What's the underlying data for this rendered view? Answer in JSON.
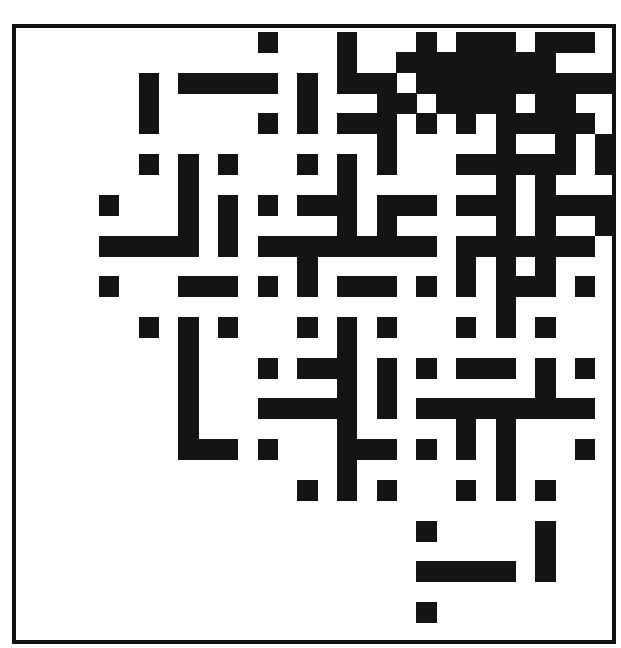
{
  "figure": {
    "type": "binary-grid-pattern",
    "grid_cols": 30,
    "grid_rows": 30,
    "cell_w": 19.83,
    "cell_h": 20.36,
    "colors": {
      "ink": "#141414",
      "paper": "#ffffff",
      "frame": "#111111"
    },
    "black_cells": [
      [
        12,
        0
      ],
      [
        16,
        0
      ],
      [
        20,
        0
      ],
      [
        22,
        0
      ],
      [
        23,
        0
      ],
      [
        24,
        0
      ],
      [
        26,
        0
      ],
      [
        27,
        0
      ],
      [
        28,
        0
      ],
      [
        16,
        1
      ],
      [
        19,
        1
      ],
      [
        20,
        1
      ],
      [
        21,
        1
      ],
      [
        22,
        1
      ],
      [
        23,
        1
      ],
      [
        24,
        1
      ],
      [
        25,
        1
      ],
      [
        26,
        1
      ],
      [
        6,
        2
      ],
      [
        8,
        2
      ],
      [
        9,
        2
      ],
      [
        10,
        2
      ],
      [
        11,
        2
      ],
      [
        12,
        2
      ],
      [
        14,
        2
      ],
      [
        16,
        2
      ],
      [
        17,
        2
      ],
      [
        18,
        2
      ],
      [
        20,
        2
      ],
      [
        21,
        2
      ],
      [
        22,
        2
      ],
      [
        23,
        2
      ],
      [
        24,
        2
      ],
      [
        25,
        2
      ],
      [
        26,
        2
      ],
      [
        27,
        2
      ],
      [
        28,
        2
      ],
      [
        29,
        2
      ],
      [
        6,
        3
      ],
      [
        14,
        3
      ],
      [
        18,
        3
      ],
      [
        19,
        3
      ],
      [
        21,
        3
      ],
      [
        22,
        3
      ],
      [
        23,
        3
      ],
      [
        24,
        3
      ],
      [
        26,
        3
      ],
      [
        27,
        3
      ],
      [
        6,
        4
      ],
      [
        12,
        4
      ],
      [
        14,
        4
      ],
      [
        16,
        4
      ],
      [
        17,
        4
      ],
      [
        18,
        4
      ],
      [
        20,
        4
      ],
      [
        22,
        4
      ],
      [
        24,
        4
      ],
      [
        25,
        4
      ],
      [
        26,
        4
      ],
      [
        27,
        4
      ],
      [
        28,
        4
      ],
      [
        18,
        5
      ],
      [
        24,
        5
      ],
      [
        27,
        5
      ],
      [
        29,
        5
      ],
      [
        6,
        6
      ],
      [
        8,
        6
      ],
      [
        10,
        6
      ],
      [
        14,
        6
      ],
      [
        16,
        6
      ],
      [
        18,
        6
      ],
      [
        22,
        6
      ],
      [
        23,
        6
      ],
      [
        24,
        6
      ],
      [
        25,
        6
      ],
      [
        26,
        6
      ],
      [
        27,
        6
      ],
      [
        29,
        6
      ],
      [
        8,
        7
      ],
      [
        16,
        7
      ],
      [
        24,
        7
      ],
      [
        26,
        7
      ],
      [
        4,
        8
      ],
      [
        8,
        8
      ],
      [
        10,
        8
      ],
      [
        12,
        8
      ],
      [
        14,
        8
      ],
      [
        15,
        8
      ],
      [
        16,
        8
      ],
      [
        18,
        8
      ],
      [
        19,
        8
      ],
      [
        20,
        8
      ],
      [
        22,
        8
      ],
      [
        23,
        8
      ],
      [
        24,
        8
      ],
      [
        26,
        8
      ],
      [
        27,
        8
      ],
      [
        28,
        8
      ],
      [
        29,
        8
      ],
      [
        8,
        9
      ],
      [
        10,
        9
      ],
      [
        16,
        9
      ],
      [
        18,
        9
      ],
      [
        24,
        9
      ],
      [
        26,
        9
      ],
      [
        29,
        9
      ],
      [
        4,
        10
      ],
      [
        5,
        10
      ],
      [
        6,
        10
      ],
      [
        7,
        10
      ],
      [
        8,
        10
      ],
      [
        10,
        10
      ],
      [
        12,
        10
      ],
      [
        13,
        10
      ],
      [
        14,
        10
      ],
      [
        15,
        10
      ],
      [
        16,
        10
      ],
      [
        17,
        10
      ],
      [
        18,
        10
      ],
      [
        19,
        10
      ],
      [
        20,
        10
      ],
      [
        22,
        10
      ],
      [
        23,
        10
      ],
      [
        24,
        10
      ],
      [
        25,
        10
      ],
      [
        26,
        10
      ],
      [
        27,
        10
      ],
      [
        28,
        10
      ],
      [
        14,
        11
      ],
      [
        22,
        11
      ],
      [
        24,
        11
      ],
      [
        26,
        11
      ],
      [
        4,
        12
      ],
      [
        8,
        12
      ],
      [
        9,
        12
      ],
      [
        10,
        12
      ],
      [
        12,
        12
      ],
      [
        14,
        12
      ],
      [
        16,
        12
      ],
      [
        17,
        12
      ],
      [
        18,
        12
      ],
      [
        20,
        12
      ],
      [
        22,
        12
      ],
      [
        24,
        12
      ],
      [
        25,
        12
      ],
      [
        26,
        12
      ],
      [
        28,
        12
      ],
      [
        24,
        13
      ],
      [
        6,
        14
      ],
      [
        8,
        14
      ],
      [
        10,
        14
      ],
      [
        14,
        14
      ],
      [
        16,
        14
      ],
      [
        18,
        14
      ],
      [
        22,
        14
      ],
      [
        24,
        14
      ],
      [
        26,
        14
      ],
      [
        8,
        15
      ],
      [
        16,
        15
      ],
      [
        8,
        16
      ],
      [
        12,
        16
      ],
      [
        14,
        16
      ],
      [
        15,
        16
      ],
      [
        16,
        16
      ],
      [
        18,
        16
      ],
      [
        20,
        16
      ],
      [
        22,
        16
      ],
      [
        23,
        16
      ],
      [
        24,
        16
      ],
      [
        26,
        16
      ],
      [
        28,
        16
      ],
      [
        8,
        17
      ],
      [
        16,
        17
      ],
      [
        18,
        17
      ],
      [
        26,
        17
      ],
      [
        8,
        18
      ],
      [
        12,
        18
      ],
      [
        13,
        18
      ],
      [
        14,
        18
      ],
      [
        15,
        18
      ],
      [
        16,
        18
      ],
      [
        18,
        18
      ],
      [
        20,
        18
      ],
      [
        21,
        18
      ],
      [
        22,
        18
      ],
      [
        23,
        18
      ],
      [
        24,
        18
      ],
      [
        25,
        18
      ],
      [
        26,
        18
      ],
      [
        27,
        18
      ],
      [
        28,
        18
      ],
      [
        8,
        19
      ],
      [
        16,
        19
      ],
      [
        22,
        19
      ],
      [
        24,
        19
      ],
      [
        8,
        20
      ],
      [
        9,
        20
      ],
      [
        10,
        20
      ],
      [
        12,
        20
      ],
      [
        16,
        20
      ],
      [
        17,
        20
      ],
      [
        18,
        20
      ],
      [
        20,
        20
      ],
      [
        22,
        20
      ],
      [
        24,
        20
      ],
      [
        28,
        20
      ],
      [
        16,
        21
      ],
      [
        24,
        21
      ],
      [
        14,
        22
      ],
      [
        16,
        22
      ],
      [
        18,
        22
      ],
      [
        22,
        22
      ],
      [
        24,
        22
      ],
      [
        26,
        22
      ],
      [
        20,
        24
      ],
      [
        26,
        24
      ],
      [
        26,
        25
      ],
      [
        20,
        26
      ],
      [
        21,
        26
      ],
      [
        22,
        26
      ],
      [
        23,
        26
      ],
      [
        24,
        26
      ],
      [
        26,
        26
      ],
      [
        20,
        28
      ]
    ]
  }
}
